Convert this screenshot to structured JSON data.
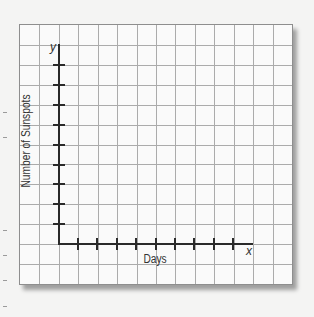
{
  "chart_data": {
    "type": "line",
    "title": "",
    "xlabel": "Days",
    "ylabel": "Number of Sunspots",
    "x_axis_var": "x",
    "y_axis_var": "y",
    "x_ticks": 9,
    "y_ticks": 9,
    "tick_labels_x": [],
    "tick_labels_y": [],
    "series": [],
    "grid": true,
    "grid_columns": 14,
    "grid_rows": 13,
    "legend": null,
    "note": "Blank graph-paper template with labeled axes; no data plotted"
  },
  "colors": {
    "grid_line": "#ababab",
    "axis": "#2a2a2a",
    "paper": "#fafafa",
    "background": "#f4f4f3"
  }
}
